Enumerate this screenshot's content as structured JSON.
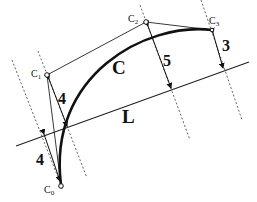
{
  "diagram": {
    "curve_label": "C",
    "line_label": "L",
    "control_points": [
      {
        "name": "C",
        "sub": "0"
      },
      {
        "name": "C",
        "sub": "1"
      },
      {
        "name": "C",
        "sub": "2"
      },
      {
        "name": "C",
        "sub": "3"
      }
    ],
    "distances": [
      {
        "label": "4",
        "from": "C0"
      },
      {
        "label": "4",
        "from": "C1"
      },
      {
        "label": "5",
        "from": "C2"
      },
      {
        "label": "3",
        "from": "C3"
      }
    ],
    "colors": {
      "stroke": "#111111",
      "dashed": "#555555",
      "background": "#ffffff"
    }
  }
}
